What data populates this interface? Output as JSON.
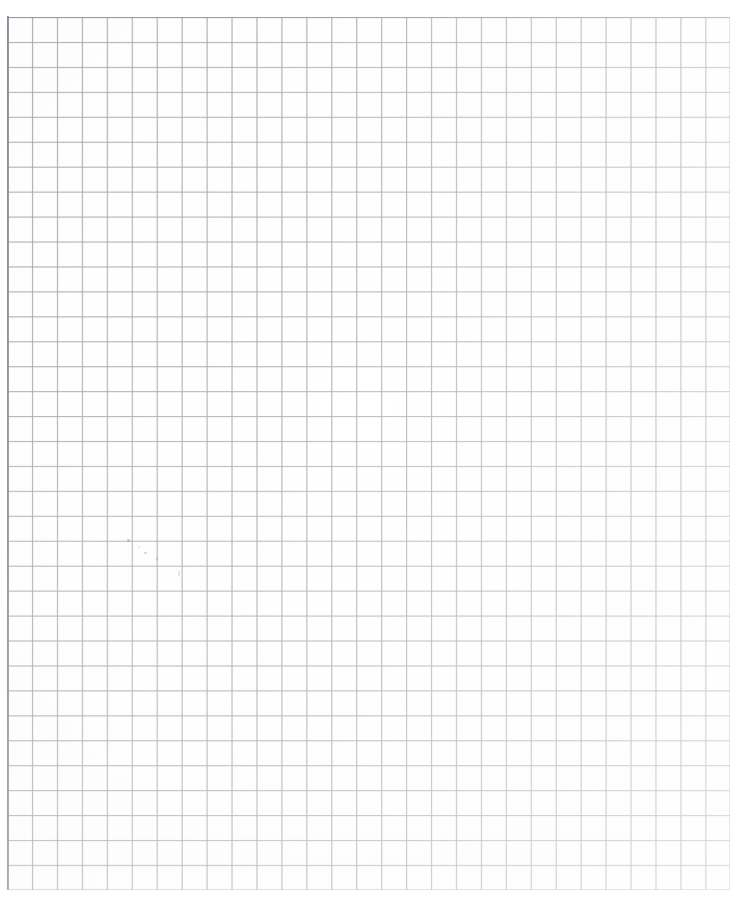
{
  "document": {
    "type": "scanned-grid-paper",
    "title": "Blank graph paper sheet",
    "description": "A scanned blank sheet of square-ruled graph paper with no written content",
    "page_width_px": 741,
    "page_height_px": 904,
    "background_color": "#fefefe",
    "visible_text": ""
  },
  "grid": {
    "name": "square-ruled grid",
    "line_color": "#969ca4",
    "ghost_line_color": "#a8aeb6",
    "frame_color": "#828891",
    "cell_size_px": 24.95,
    "columns": 29,
    "rows": 35,
    "origin_x_px": 7,
    "origin_y_px": 17,
    "grid_width_px": 723,
    "grid_height_px": 873,
    "has_major_lines": false
  },
  "marks": {
    "top_artifact": {
      "name": "scan-artifact-top",
      "color": "#2b2b2b",
      "x_px": 386,
      "y_px": 1,
      "width_px": 11,
      "height_px": 5
    },
    "pencil_smudges": [
      {
        "x_px": 127,
        "y_px": 539,
        "width_px": 3,
        "height_px": 3,
        "opacity": 0.5
      },
      {
        "x_px": 144,
        "y_px": 552,
        "width_px": 3,
        "height_px": 2,
        "opacity": 0.45
      },
      {
        "x_px": 156,
        "y_px": 557,
        "width_px": 2,
        "height_px": 3,
        "opacity": 0.4
      },
      {
        "x_px": 178,
        "y_px": 571,
        "width_px": 2,
        "height_px": 5,
        "opacity": 0.3
      },
      {
        "x_px": 138,
        "y_px": 546,
        "width_px": 2,
        "height_px": 2,
        "opacity": 0.25
      }
    ]
  },
  "chart_data": {
    "type": "table",
    "xlabel": "",
    "ylabel": "",
    "categories": [],
    "values": [],
    "grid": true,
    "legend": "none"
  }
}
